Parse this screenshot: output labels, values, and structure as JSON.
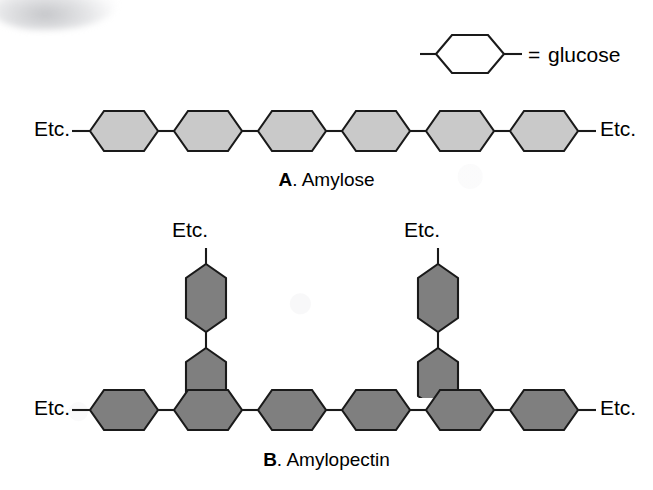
{
  "figure": {
    "legend": {
      "symbol_name": "hexagon-outline",
      "equals_sign": "=",
      "term": "glucose"
    },
    "panels": [
      {
        "id": "A",
        "letter": "A",
        "separator": ". ",
        "name": "Amylose",
        "caption": "A. Amylose",
        "structure": "unbranched-chain",
        "unit_count": 6,
        "fill_color": "#c9c9c9",
        "left_label": "Etc.",
        "right_label": "Etc.",
        "branches": []
      },
      {
        "id": "B",
        "letter": "B",
        "separator": ". ",
        "name": "Amylopectin",
        "caption": "B. Amylopectin",
        "structure": "branched-chain",
        "unit_count": 6,
        "fill_color": "#7f7f7f",
        "left_label": "Etc.",
        "right_label": "Etc.",
        "branches": [
          {
            "attached_to_unit": 2,
            "unit_count": 2,
            "top_label": "Etc."
          },
          {
            "attached_to_unit": 5,
            "unit_count": 2,
            "top_label": "Etc."
          }
        ]
      }
    ],
    "colors": {
      "outline": "#1a1a1a",
      "background": "#ffffff",
      "amylose_fill": "#c9c9c9",
      "amylopectin_fill": "#7f7f7f",
      "legend_fill": "#ffffff"
    }
  }
}
